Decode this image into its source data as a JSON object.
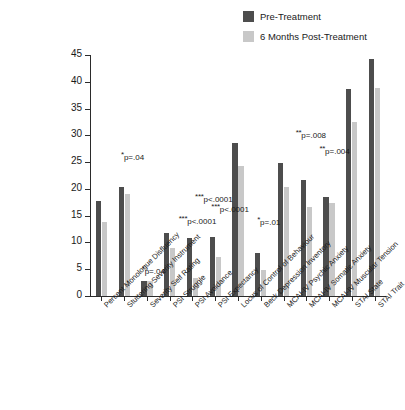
{
  "legend": {
    "position": "top-right",
    "entries": [
      {
        "label": "Pre-Treatment",
        "color": "#4d4d4d"
      },
      {
        "label": "6 Months Post-Treatment",
        "color": "#c8c8c8"
      }
    ]
  },
  "chart_data": {
    "type": "bar",
    "title": "",
    "subtitle": "",
    "xlabel": "",
    "ylabel": "",
    "ylim": [
      0,
      45
    ],
    "yticks": [
      0,
      5,
      10,
      15,
      20,
      25,
      30,
      35,
      40,
      45
    ],
    "grid": false,
    "legend_position": "top-right",
    "categories": [
      "Percent Monologue Disfluency",
      "Stuttering Severity Instrument",
      "Severity Self Rating",
      "PSI Struggle",
      "PSI Avoidance",
      "PSI Expectancy",
      "Locus of Control of Behaviour",
      "Beck Depression Inventory",
      "MCAI-IV Psychic Anxiety",
      "MCAI-IV Somatic Anxiety",
      "MCAI-IV Muscular Tension",
      "STAI State",
      "STAI Trait"
    ],
    "series": [
      {
        "name": "Pre-Treatment",
        "color": "#4d4d4d",
        "values": [
          17.8,
          20.4,
          2.8,
          11.7,
          10.8,
          11.0,
          28.5,
          8.0,
          24.8,
          21.6,
          18.5,
          38.6,
          44.2
        ]
      },
      {
        "name": "6 Months Post-Treatment",
        "color": "#c8c8c8",
        "values": [
          13.8,
          19.1,
          2.8,
          8.9,
          3.3,
          7.3,
          24.2,
          4.8,
          20.3,
          16.6,
          17.4,
          32.4,
          38.9
        ]
      }
    ],
    "annotations": [
      {
        "text": "p=.04",
        "stars": "*",
        "category": "Stuttering Severity Instrument",
        "x_frac": 0.105,
        "y_value": 27.3
      },
      {
        "text": "p=.04",
        "stars": "*",
        "category": "Severity Self Rating",
        "x_frac": 0.175,
        "y_value": 6.0
      },
      {
        "text": "p<.0001",
        "stars": "***",
        "category": "PSI Struggle",
        "x_frac": 0.3,
        "y_value": 15.4
      },
      {
        "text": "p<.0001",
        "stars": "***",
        "category": "PSI Avoidance",
        "x_frac": 0.355,
        "y_value": 19.4
      },
      {
        "text": "p<.0001",
        "stars": "***",
        "category": "PSI Expectancy",
        "x_frac": 0.41,
        "y_value": 17.6
      },
      {
        "text": "p=.01",
        "stars": "*",
        "category": "Beck Depression Inventory",
        "x_frac": 0.565,
        "y_value": 15.1
      },
      {
        "text": "p=.008",
        "stars": "**",
        "category": "MCAI-IV Somatic Anxiety",
        "x_frac": 0.695,
        "y_value": 31.4
      },
      {
        "text": "p=.004",
        "stars": "**",
        "category": "MCAI-IV Muscular Tension",
        "x_frac": 0.775,
        "y_value": 28.3
      }
    ]
  }
}
